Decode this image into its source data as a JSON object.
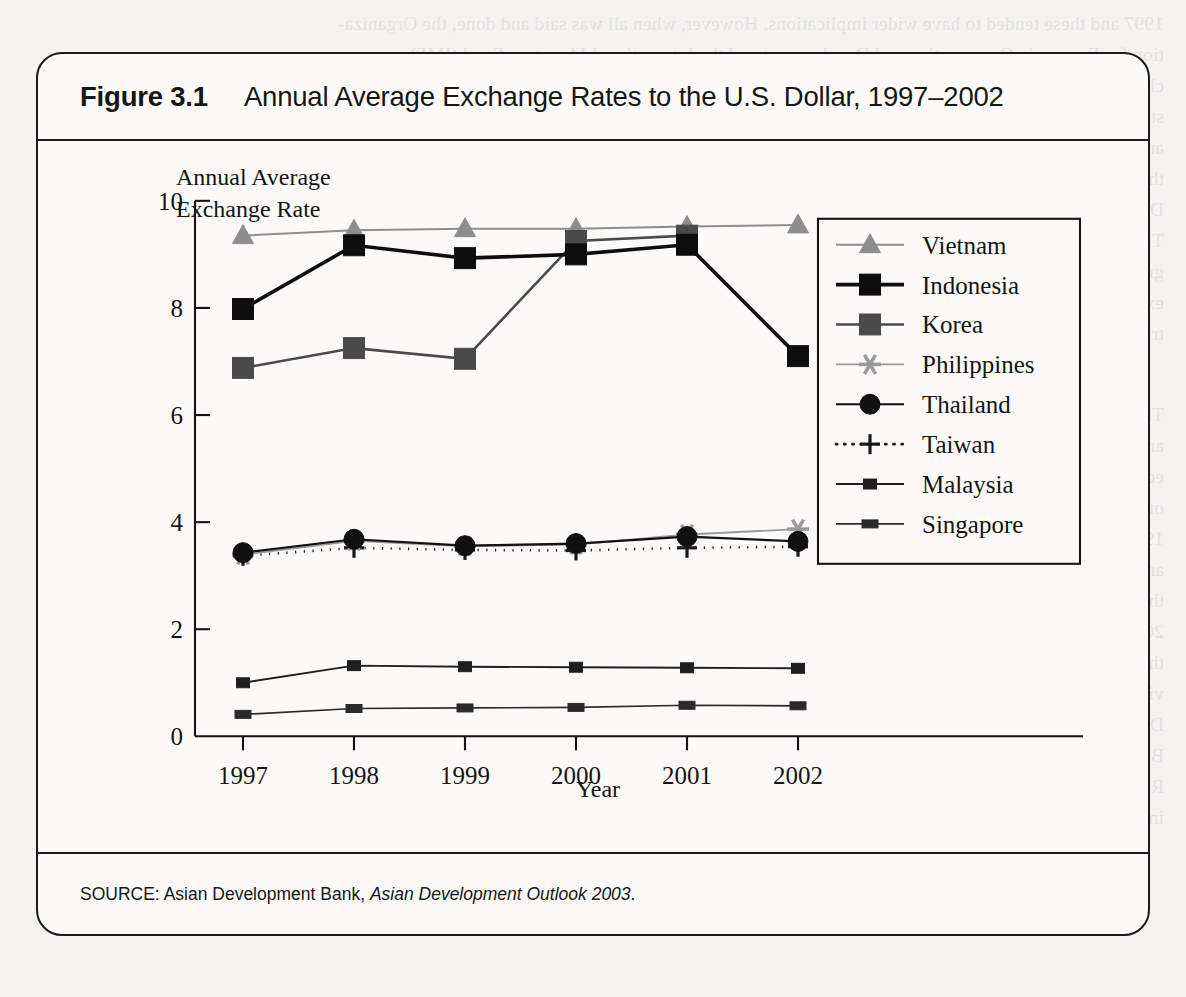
{
  "figure": {
    "number_label": "Figure 3.1",
    "title": "Annual Average Exchange Rates to the U.S. Dollar, 1997–2002",
    "source_prefix": "SOURCE: Asian Development Bank,",
    "source_italic": "Asian Development Outlook 2003",
    "source_suffix": "."
  },
  "axes": {
    "y_label_line1": "Annual Average",
    "y_label_line2": "Exchange Rate",
    "x_label": "Year",
    "y_ticks": [
      "0",
      "2",
      "4",
      "6",
      "8",
      "10"
    ],
    "x_ticks": [
      "1997",
      "1998",
      "1999",
      "2000",
      "2001",
      "2002"
    ]
  },
  "colors": {
    "ink": "#141414",
    "vietnam": "#8d8d8d",
    "indonesia": "#0d0d0d",
    "korea": "#4a4a4a",
    "philippines": "#9a9a9a",
    "thailand": "#111111",
    "taiwan": "#1a1a1a",
    "malaysia": "#1f1f1f",
    "singapore": "#2a2a2a",
    "paper": "#fbfaf9",
    "page": "#f4f3f1"
  },
  "chart_data": {
    "type": "line",
    "title": "Annual Average Exchange Rates to the U.S. Dollar, 1997–2002",
    "xlabel": "Year",
    "ylabel": "Annual Average Exchange Rate",
    "x": [
      "1997",
      "1998",
      "1999",
      "2000",
      "2001",
      "2002"
    ],
    "ylim": [
      0,
      10
    ],
    "yticks": [
      0,
      2,
      4,
      6,
      8,
      10
    ],
    "grid": false,
    "legend_position": "upper-right-inside",
    "note": "Values are plotted on an index/log-style scale as printed; read off the axis.",
    "series": [
      {
        "name": "Vietnam",
        "marker": "triangle",
        "color": "#8d8d8d",
        "linewidth": 2.0,
        "dash": "none",
        "values": [
          9.35,
          9.45,
          9.48,
          9.48,
          9.52,
          9.55
        ]
      },
      {
        "name": "Indonesia",
        "marker": "square-large",
        "color": "#0d0d0d",
        "linewidth": 3.6,
        "dash": "none",
        "values": [
          7.98,
          9.17,
          8.93,
          9.0,
          9.18,
          7.1
        ]
      },
      {
        "name": "Korea",
        "marker": "square-large",
        "color": "#4a4a4a",
        "linewidth": 2.6,
        "dash": "none",
        "values": [
          6.88,
          7.25,
          7.05,
          9.25,
          9.35,
          null
        ]
      },
      {
        "name": "Philippines",
        "marker": "asterisk",
        "color": "#9a9a9a",
        "linewidth": 1.9,
        "dash": "none",
        "values": [
          3.39,
          3.65,
          3.55,
          3.58,
          3.77,
          3.87
        ]
      },
      {
        "name": "Thailand",
        "marker": "circle",
        "color": "#111111",
        "linewidth": 2.2,
        "dash": "none",
        "values": [
          3.43,
          3.68,
          3.56,
          3.6,
          3.73,
          3.64
        ]
      },
      {
        "name": "Taiwan",
        "marker": "plus",
        "color": "#1a1a1a",
        "linewidth": 2.6,
        "dash": "dotted",
        "values": [
          3.37,
          3.52,
          3.48,
          3.47,
          3.52,
          3.54
        ]
      },
      {
        "name": "Malaysia",
        "marker": "square-small",
        "color": "#1f1f1f",
        "linewidth": 1.9,
        "dash": "none",
        "values": [
          1.0,
          1.32,
          1.3,
          1.29,
          1.28,
          1.27
        ]
      },
      {
        "name": "Singapore",
        "marker": "dash-small",
        "color": "#2a2a2a",
        "linewidth": 1.7,
        "dash": "none",
        "values": [
          0.41,
          0.52,
          0.53,
          0.54,
          0.58,
          0.57
        ]
      }
    ]
  },
  "legend": {
    "entries": [
      "Vietnam",
      "Indonesia",
      "Korea",
      "Philippines",
      "Thailand",
      "Taiwan",
      "Malaysia",
      "Singapore"
    ]
  },
  "bleed_text": {
    "lines": [
      "1997 and these tended to have wider implications. However, when all was said and done, the Organiza-",
      "tion for Economic Co-operation and Development and the International Monetary Fund (IMF) con-",
      "cluded that the recession that afflicted the United States and the global economy in 2001 was not sub-",
      "stantially the result of a slowdown in the growth of the U.S. economy. Asia as a whole, excluding India",
      "and China, which both grew rapidly, registered growth of between 1 and 2 percent in 2001. Although",
      "this was much lower than the 1997 figure, for it did not then world trade decline.",
      "During 2001, investment spending and trade put pressure on the economies of Asia.",
      "The region suffered a short and sharp recession from which it recovered only slowly in 2002. This reduced the",
      "growth of international trade also slowed the growth of the Asian economies, and other countries",
      "expected to recover before the financial crisis. However, as the United States and other industrial coun-",
      "tries returned to growth this had a salutary impact on growth in the Asian economies.",
      "3.3.2   Economic Growth",
      "The overall economic growth in the Asian region suffered but international realms of countries in that sector",
      "and in foreign exchange markets followed. In 1998, the regional economic growth rates in that Asian",
      "economic growth was negative in all the five crisis countries, as well as Hong Kong. Singapore grew by",
      "only 0.1 percent compared with 8.5 percent growth in 1997. There was, however, a rapid recovery in",
      "1999, which strengthened in 2000. Growth rates in the crisis-hit countries (see Table 3.2). The recovery",
      "and Korea was particularly significant. The revival of growth in the United States and",
      "the other industrial countries had an important effect on the export-oriented economies of East Asia in",
      "2000. The effect of this slowdown on the industrial countries was particularly severe in those countries",
      "that had strong trade linkages with the United States, and where international trade in electronics was",
      "vital. This group of countries included Malaysia, Singapore, and Taiwan among others.",
      "During the following two years, the global economy recovered and so did the Asian economies.",
      "Between 2003 and 2002, economic growth in the whole region accelerated, led by India and China.",
      "Rising domestic cost and poverty for the value, and domestic economies and foreign trade were both",
      "important factors in the resumption of growth."
    ]
  }
}
